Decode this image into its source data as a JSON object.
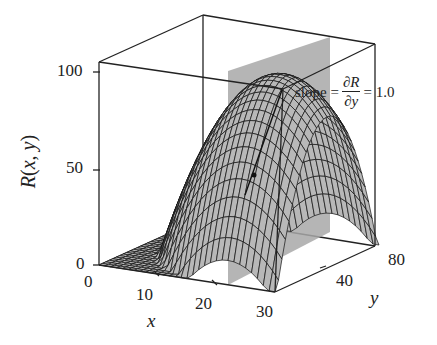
{
  "chart_data": {
    "type": "surface3d",
    "title": "",
    "function_label": "R(x, y)",
    "xlabel": "x",
    "ylabel": "y",
    "zlabel": "R(x, y)",
    "x_ticks": [
      "0",
      "10",
      "20",
      "30"
    ],
    "y_ticks": [
      "40",
      "80"
    ],
    "z_ticks": [
      "0",
      "50",
      "100"
    ],
    "xlim": [
      0,
      30
    ],
    "ylim": [
      0,
      80
    ],
    "zlim": [
      0,
      100
    ],
    "slice_plane": {
      "x": 23,
      "color": "#a0a0a0"
    },
    "tangent_annotation": {
      "prefix": "slope =",
      "numerator": "∂R",
      "denominator": "∂y",
      "suffix": "= 1.0",
      "slope_value": 1.0
    },
    "surface": "concave-down paraboloid peaking near R = 90 at mid-range x and y",
    "colors": {
      "surface": "#b8b8b8",
      "mesh": "#111111",
      "plane": "#a0a0a0",
      "box": "#222222"
    }
  },
  "axes": {
    "z_ticks": [
      {
        "label": "100"
      },
      {
        "label": "50"
      },
      {
        "label": "0"
      }
    ],
    "x_ticks": [
      {
        "label": "0"
      },
      {
        "label": "10"
      },
      {
        "label": "20"
      },
      {
        "label": "30"
      }
    ],
    "y_ticks": [
      {
        "label": "40"
      },
      {
        "label": "80"
      }
    ],
    "zlabel": {
      "main": "R",
      "open": "(",
      "x": "x",
      "comma": ", ",
      "y": "y",
      "close": ")"
    },
    "xlabel": "x",
    "ylabel": "y"
  },
  "annotation": {
    "prefix": "slope =",
    "numerator": "∂R",
    "denominator": "∂y",
    "suffix": "= 1.0"
  }
}
